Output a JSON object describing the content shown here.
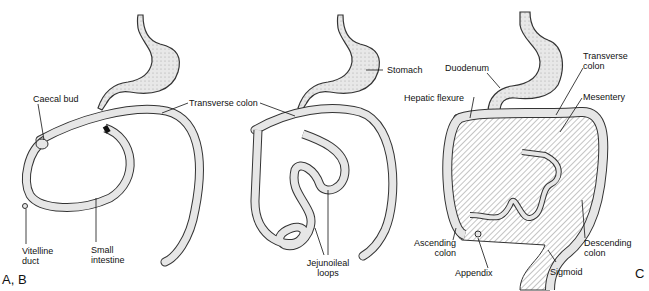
{
  "figure": {
    "panels": [
      "A, B",
      "C"
    ],
    "panel_a": {
      "labels": {
        "caecal_bud": "Caecal bud",
        "transverse_colon": "Transverse colon",
        "vitelline_duct_1": "Vitelline",
        "vitelline_duct_2": "duct",
        "small_intestine_1": "Small",
        "small_intestine_2": "intestine"
      }
    },
    "panel_b": {
      "labels": {
        "stomach": "Stomach",
        "jejunoileal_1": "Jejunoileal",
        "jejunoileal_2": "loops"
      }
    },
    "panel_c": {
      "labels": {
        "duodenum": "Duodenum",
        "transverse_colon_1": "Transverse",
        "transverse_colon_2": "colon",
        "hepatic_flexure": "Hepatic flexure",
        "mesentery": "Mesentery",
        "ascending_colon_1": "Ascending",
        "ascending_colon_2": "colon",
        "appendix": "Appendix",
        "sigmoid": "Sigmoid",
        "descending_colon_1": "Descending",
        "descending_colon_2": "colon"
      }
    },
    "colors": {
      "tissue_fill": "#e6e6e6",
      "outline": "#333333",
      "background": "#ffffff"
    }
  }
}
